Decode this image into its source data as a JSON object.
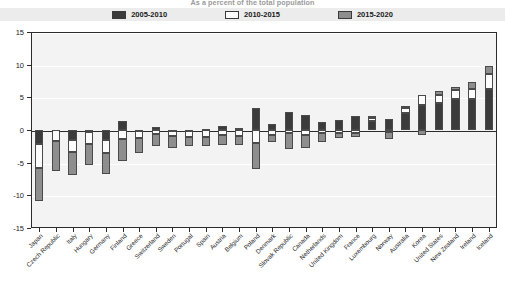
{
  "chart_data": {
    "type": "bar",
    "subtype": "stacked-diverging-bar",
    "title": "As a percent of the total population",
    "xlabel": "",
    "ylabel": "",
    "ylim": [
      -15,
      15
    ],
    "yticks": [
      15,
      10,
      5,
      0,
      -5,
      -10,
      -15
    ],
    "grid": true,
    "legend_position": "top",
    "categories": [
      "Japan",
      "Czech Republic",
      "Italy",
      "Hungary",
      "Germany",
      "Finland",
      "Greece",
      "Switzerland",
      "Sweden",
      "Portugal",
      "Spain",
      "Austria",
      "Belgium",
      "Poland",
      "Denmark",
      "Slovak Republic",
      "Canada",
      "Netherlands",
      "United Kingdom",
      "France",
      "Luxembourg",
      "Norway",
      "Australia",
      "Korea",
      "United States",
      "New Zealand",
      "Ireland",
      "Iceland"
    ],
    "series": [
      {
        "name": "2005-2010",
        "color": "#3b3b3b",
        "values": [
          -2.2,
          0.0,
          -1.5,
          -0.3,
          -1.6,
          1.4,
          -0.2,
          0.5,
          -0.2,
          -0.1,
          0.2,
          0.6,
          0.3,
          3.4,
          0.9,
          2.7,
          2.3,
          1.2,
          1.5,
          2.2,
          1.4,
          1.7,
          2.6,
          3.9,
          4.1,
          4.7,
          4.7,
          6.3
        ]
      },
      {
        "name": "2010-2015",
        "color": "#ffffff",
        "values": [
          -3.6,
          -1.7,
          -1.9,
          -1.8,
          -1.9,
          -1.4,
          -1.0,
          -0.6,
          -0.7,
          -0.9,
          -1.0,
          -0.7,
          -0.9,
          -2.0,
          -0.7,
          -0.5,
          -0.7,
          -0.5,
          -0.4,
          -0.5,
          0.5,
          -0.3,
          0.8,
          1.4,
          1.3,
          1.4,
          1.6,
          2.2
        ]
      },
      {
        "name": "2015-2020",
        "color": "#8e8e8e",
        "values": [
          -5.0,
          -4.6,
          -3.5,
          -3.2,
          -3.3,
          -3.4,
          -2.3,
          -1.9,
          -1.8,
          -1.5,
          -1.5,
          -1.6,
          -1.4,
          -3.9,
          -1.1,
          -2.4,
          -2.1,
          -1.3,
          -0.9,
          -0.5,
          0.3,
          -1.1,
          0.2,
          -0.8,
          0.6,
          0.5,
          1.1,
          1.3
        ]
      }
    ]
  },
  "legend": {
    "items": [
      {
        "label": "2005-2010",
        "swatch": "dark"
      },
      {
        "label": "2010-2015",
        "swatch": "white"
      },
      {
        "label": "2015-2020",
        "swatch": "gray"
      }
    ]
  }
}
